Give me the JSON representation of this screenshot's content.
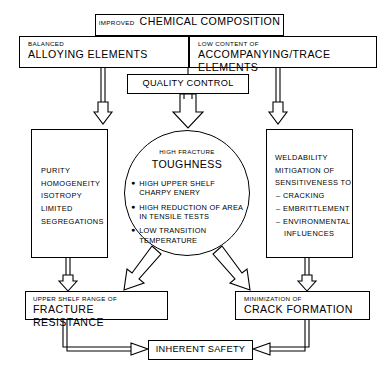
{
  "diagram": {
    "colors": {
      "line": "#000000",
      "background": "#ffffff"
    }
  },
  "nodes": {
    "chemical_composition": {
      "small": "IMPROVED",
      "main": "CHEMICAL COMPOSITION"
    },
    "balanced": {
      "small": "BALANCED",
      "main": "ALLOYING ELEMENTS"
    },
    "trace": {
      "small": "LOW CONTENT OF",
      "main": "ACCOMPANYING/TRACE ELEMENTS"
    },
    "quality_control": {
      "main": "QUALITY CONTROL"
    },
    "purity": {
      "lines": [
        "PURITY",
        "HOMOGENEITY",
        "ISOTROPY",
        "LIMITED",
        "SEGREGATIONS"
      ]
    },
    "toughness": {
      "small": "HIGH FRACTURE",
      "main": "TOUGHNESS",
      "bullets": [
        {
          "marker": "●",
          "line1": "HIGH UPPER SHELF",
          "line2": "CHARPY ENERY"
        },
        {
          "marker": "●",
          "line1": "HIGH REDUCTION OF AREA",
          "line2": "IN TENSILE TESTS"
        },
        {
          "marker": "●",
          "line1": "LOW TRANSITION",
          "line2": "TEMPERATURE"
        }
      ]
    },
    "weldability": {
      "heading": [
        "WELDABILITY",
        "MITIGATION OF",
        "SENSITIVENESS TO"
      ],
      "items": [
        {
          "marker": "–",
          "line1": "CRACKING",
          "line2": ""
        },
        {
          "marker": "–",
          "line1": "EMBRITTLEMENT",
          "line2": ""
        },
        {
          "marker": "–",
          "line1": "ENVIRONMENTAL",
          "line2": "INFLUENCES"
        }
      ]
    },
    "fracture_resistance": {
      "small": "UPPER SHELF RANGE OF",
      "main": "FRACTURE RESISTANCE"
    },
    "crack_formation": {
      "small": "MINIMIZATION OF",
      "main": "CRACK FORMATION"
    },
    "inherent_safety": {
      "main": "INHERENT SAFETY"
    }
  },
  "connectors": [
    {
      "name": "chem-to-balanced",
      "style": "double-line-arrow",
      "direction": "down"
    },
    {
      "name": "chem-to-trace",
      "style": "double-line-arrow",
      "direction": "down"
    },
    {
      "name": "quality-to-circle",
      "style": "hollow-arrow",
      "direction": "down"
    },
    {
      "name": "balanced-to-purity",
      "style": "double-line-arrow",
      "direction": "down"
    },
    {
      "name": "trace-to-weldability",
      "style": "double-line-arrow",
      "direction": "down"
    },
    {
      "name": "circle-to-fracture-resistance",
      "style": "hollow-arrow",
      "direction": "down-left"
    },
    {
      "name": "circle-to-crack-formation",
      "style": "hollow-arrow",
      "direction": "down-right"
    },
    {
      "name": "purity-to-fracture-resistance",
      "style": "double-line-arrow",
      "direction": "down"
    },
    {
      "name": "weldability-to-crack-formation",
      "style": "double-line-arrow",
      "direction": "down"
    },
    {
      "name": "fracture-resistance-to-safety",
      "style": "double-line-arrow",
      "direction": "down-right-elbow"
    },
    {
      "name": "crack-formation-to-safety",
      "style": "double-line-arrow",
      "direction": "down-left-elbow"
    }
  ]
}
